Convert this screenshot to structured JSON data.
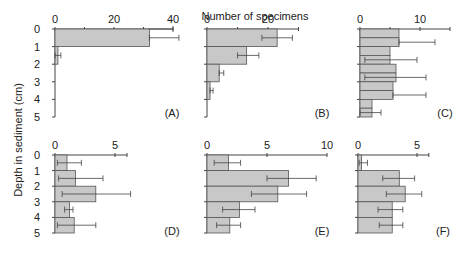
{
  "chart_data": {
    "type": "bar",
    "orientation": "horizontal",
    "title": "",
    "xlabel": "Number of specimens",
    "ylabel": "Depth in sediment (cm)",
    "depth_ticks": [
      "0",
      "1",
      "2",
      "3",
      "4",
      "5"
    ],
    "panels": [
      {
        "label": "(A)",
        "xlim": [
          0,
          40
        ],
        "xticks": [
          "0",
          "20",
          "40"
        ],
        "minor_ticks": [
          10,
          30
        ],
        "categories": [
          "0-1",
          "1-2",
          "2-3",
          "3-4",
          "4-5"
        ],
        "values": [
          32,
          1,
          0,
          0,
          0
        ],
        "err_low": [
          32,
          0,
          0,
          0,
          0
        ],
        "err_high": [
          42,
          2,
          0,
          0,
          0
        ],
        "err_upper_line": 40
      },
      {
        "label": "(B)",
        "xlim": [
          0,
          30
        ],
        "xticks": [
          "0",
          "20"
        ],
        "minor_ticks": [
          10,
          30
        ],
        "categories": [
          "0-1",
          "1-2",
          "2-3",
          "3-4",
          "4-5"
        ],
        "values": [
          23,
          13,
          4,
          1,
          0
        ],
        "err_low": [
          18,
          10,
          4,
          1,
          0
        ],
        "err_high": [
          28,
          17,
          5.5,
          2,
          0
        ]
      },
      {
        "label": "(C)",
        "xlim": [
          0,
          15
        ],
        "xticks": [
          "0",
          "10"
        ],
        "minor_ticks": [
          5,
          15
        ],
        "categories": [
          "0-0.5",
          "0.5-1",
          "1-1.5",
          "1.5-2",
          "2-2.5",
          "2.5-3",
          "3-3.5",
          "3.5-4",
          "4-4.5",
          "4.5-5"
        ],
        "values": [
          6.5,
          6.5,
          5,
          5,
          6,
          6,
          5.5,
          5.5,
          2,
          2
        ],
        "err_low": [
          null,
          6.5,
          null,
          0.8,
          null,
          0.8,
          null,
          5.5,
          null,
          0
        ],
        "err_high": [
          null,
          12.5,
          null,
          9.5,
          null,
          11,
          null,
          11,
          null,
          3.5
        ]
      },
      {
        "label": "(D)",
        "xlim": [
          0,
          6
        ],
        "xticks": [
          "0",
          "5"
        ],
        "minor_ticks": [
          6
        ],
        "categories": [
          "0-1",
          "1-2",
          "2-3",
          "3-4",
          "4-5"
        ],
        "values": [
          1,
          1.7,
          3.4,
          1.2,
          1.6
        ],
        "err_low": [
          0.2,
          0.3,
          0.6,
          0.8,
          0.2
        ],
        "err_high": [
          2.2,
          4,
          6.3,
          1.5,
          3.4
        ]
      },
      {
        "label": "(E)",
        "xlim": [
          0,
          10
        ],
        "xticks": [
          "0",
          "5",
          "10"
        ],
        "minor_ticks": [],
        "categories": [
          "0-1",
          "1-2",
          "2-3",
          "3-4",
          "4-5"
        ],
        "values": [
          1.8,
          6.8,
          5.9,
          2.7,
          1.9
        ],
        "err_low": [
          0.6,
          5,
          3.7,
          1.3,
          0.8
        ],
        "err_high": [
          2.8,
          9.1,
          8.3,
          4,
          2.8
        ]
      },
      {
        "label": "(F)",
        "xlim": [
          0,
          6
        ],
        "xticks": [
          "0",
          "5"
        ],
        "minor_ticks": [
          6
        ],
        "categories": [
          "0-1",
          "1-2",
          "2-3",
          "3-4",
          "4-5"
        ],
        "values": [
          0.3,
          3.5,
          4,
          2.9,
          2.9
        ],
        "err_low": [
          0.1,
          2.1,
          2.4,
          1.7,
          1.8
        ],
        "err_high": [
          0.8,
          4.8,
          5.4,
          3.8,
          3.8
        ]
      }
    ],
    "grid": false,
    "legend": "none"
  }
}
